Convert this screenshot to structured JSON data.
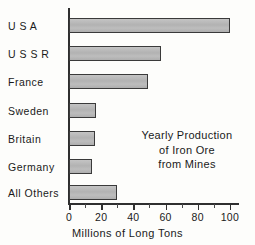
{
  "chart_data": {
    "type": "bar",
    "orientation": "horizontal",
    "title": "",
    "categories": [
      "U S A",
      "U S S R",
      "France",
      "Sweden",
      "Britain",
      "Germany",
      "All Others"
    ],
    "values": [
      100,
      57,
      49,
      17,
      16,
      14,
      30
    ],
    "xlabel": "Millions of Long Tons",
    "ylabel": "",
    "xlim": [
      0,
      105
    ],
    "xticks": [
      0,
      20,
      40,
      60,
      80,
      100
    ],
    "xtick_labels": [
      "0",
      "20",
      "40",
      "60",
      "80",
      "100"
    ],
    "minor_xticks": [
      10,
      30,
      50,
      70,
      90
    ],
    "grid": false,
    "legend": null,
    "annotations": [
      {
        "lines": [
          "Yearly Production",
          "of Iron Ore",
          "from Mines"
        ],
        "position": "inside-right-middle"
      }
    ],
    "series": [
      {
        "name": "Iron Ore Production",
        "values": [
          100,
          57,
          49,
          17,
          16,
          14,
          30
        ]
      }
    ],
    "colors": {
      "bar_fill": "#b5b5b5",
      "bar_border": "#3a3a3a",
      "axis": "#2f2f2f",
      "text": "#1a1a1a",
      "background": "#fdfdfb"
    }
  },
  "annotation": {
    "line1": "Yearly Production",
    "line2": "of Iron Ore",
    "line3": "from Mines"
  },
  "axis": {
    "xlabel": "Millions of Long Tons"
  }
}
